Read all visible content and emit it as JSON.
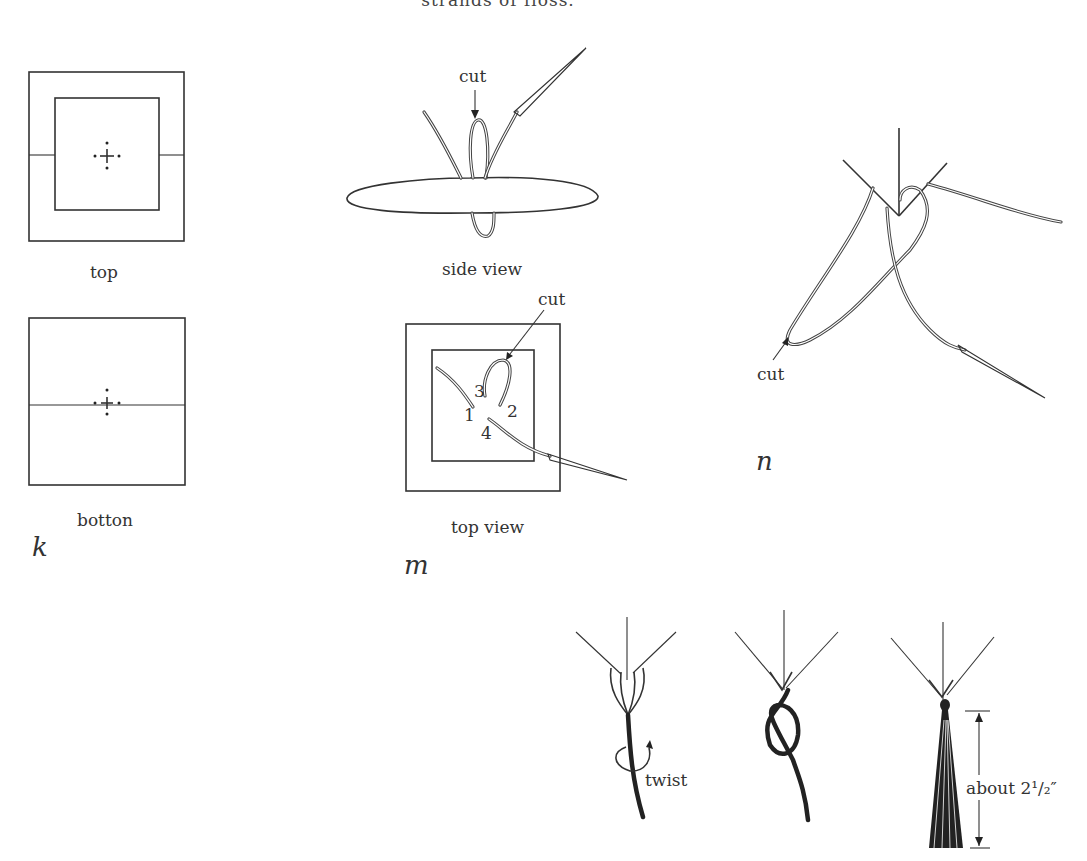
{
  "header": {
    "truncated_text": "strands of floss."
  },
  "figure_k": {
    "letter": "k",
    "panels": [
      {
        "caption": "top"
      },
      {
        "caption": "botton"
      }
    ]
  },
  "figure_m": {
    "letter": "m",
    "side_view": {
      "caption": "side view",
      "annotation": "cut"
    },
    "top_view": {
      "caption": "top view",
      "annotation": "cut",
      "step_numbers": [
        "1",
        "2",
        "3",
        "4"
      ]
    }
  },
  "figure_n": {
    "letter": "n",
    "annotation": "cut"
  },
  "tassel_steps": {
    "step1_label": "twist",
    "step3_measure": "about 2¹/₂″"
  }
}
